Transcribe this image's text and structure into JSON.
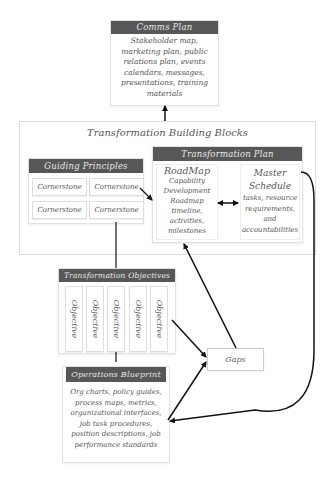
{
  "comms_plan": {
    "title": "Comms Plan",
    "body": "Stakeholder map, marketing plan, public relations plan, events calendars, messages, presentations, training materials"
  },
  "building_blocks": {
    "title": "Transformation Building Blocks",
    "guiding_principles": {
      "title": "Guiding Principles",
      "items": [
        "Cornerstone",
        "Cornerstone",
        "Cornerstone",
        "Cornerstone"
      ]
    },
    "transformation_plan": {
      "title": "Transformation Plan",
      "roadmap": {
        "title": "RoadMap",
        "body": "Capability Development Roadmap timeline, activities, milestones"
      },
      "master_schedule": {
        "title": "Master Schedule",
        "body": "tasks, resource requirements, and accountabilities"
      }
    }
  },
  "transformation_objectives": {
    "title": "Transformation Objectives",
    "items": [
      "Objective",
      "Objective",
      "Objective",
      "Objective",
      "Objective"
    ]
  },
  "gaps": {
    "label": "Gaps"
  },
  "operations_blueprint": {
    "title": "Operations Blueprint",
    "body": "Org charts, policy guides, process maps, metrics, organizational interfaces, job task procedures, position descriptions, job performance standards"
  },
  "colors": {
    "header_bg": "#575757",
    "header_text": "#e8e8e8",
    "border": "#e2e2e2",
    "arrow": "#111111"
  }
}
